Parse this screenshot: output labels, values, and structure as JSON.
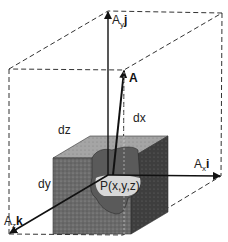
{
  "figure": {
    "type": "vector-component-diagram",
    "labels": {
      "vector": "A",
      "ay_base": "A",
      "ay_sub": "y",
      "ay_unit": "j",
      "ax_base": "A",
      "ax_sub": "x",
      "ax_unit": "i",
      "az_base": "A",
      "az_sub": "z",
      "az_unit": "k",
      "dx": "dx",
      "dy": "dy",
      "dz": "dz",
      "point": "P(x,y,z)"
    },
    "colors": {
      "line": "#111111",
      "dashed": "#333333",
      "cube_front": "#6e6e6e",
      "cube_top": "#9a9a9a",
      "cube_side": "#3e3e3e",
      "cutout": "#cfcfcf",
      "background": "#ffffff"
    }
  }
}
